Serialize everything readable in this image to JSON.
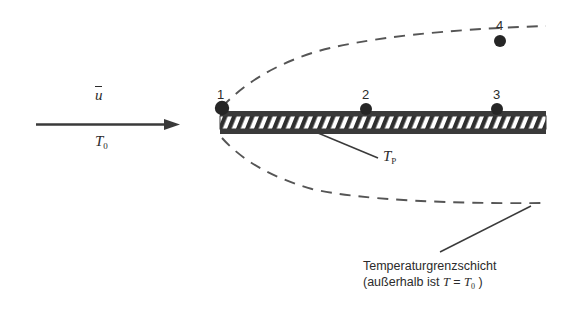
{
  "figure": {
    "kind": "thermal-boundary-layer-flat-plate-diagram",
    "colors": {
      "ink": "#2b2b2b",
      "plate_edge": "#3a3a3a",
      "hatch": "#2f2f2f",
      "dashed": "#555555",
      "background": "#ffffff"
    }
  },
  "flow": {
    "velocity_symbol": "u",
    "velocity_label_has_overbar": true,
    "temperature_symbol": "T",
    "temperature_subscript": "0",
    "arrow_direction": "right"
  },
  "plate": {
    "surface_temperature_symbol": "T",
    "surface_temperature_subscript": "P",
    "hatch_pattern": "diagonal-forward"
  },
  "points": [
    {
      "id": "point-1",
      "label": "1"
    },
    {
      "id": "point-2",
      "label": "2"
    },
    {
      "id": "point-3",
      "label": "3"
    },
    {
      "id": "point-4",
      "label": "4"
    }
  ],
  "boundary_layer": {
    "caption_line_1": "Temperaturgrenzschicht",
    "caption_line_2_prefix": "(außerhalb ist ",
    "caption_line_2_symbol_t": "T",
    "caption_line_2_equals": " = ",
    "caption_line_2_symbol_t0": "T",
    "caption_line_2_subscript": "0",
    "caption_line_2_suffix": " )"
  }
}
